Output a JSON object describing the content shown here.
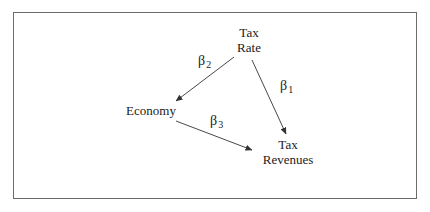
{
  "diagram": {
    "type": "causal-path-diagram",
    "nodes": [
      {
        "id": "tax_rate",
        "lines": [
          "Tax",
          "Rate"
        ]
      },
      {
        "id": "economy",
        "lines": [
          "Economy"
        ]
      },
      {
        "id": "tax_revenues",
        "lines": [
          "Tax",
          "Revenues"
        ]
      }
    ],
    "edges": [
      {
        "from": "tax_rate",
        "to": "tax_revenues",
        "label_symbol": "β",
        "label_subscript": "1"
      },
      {
        "from": "tax_rate",
        "to": "economy",
        "label_symbol": "β",
        "label_subscript": "2"
      },
      {
        "from": "economy",
        "to": "tax_revenues",
        "label_symbol": "β",
        "label_subscript": "3"
      }
    ],
    "colors": {
      "frame": "#6b6b6b",
      "arrow": "#333333",
      "text": "#1a1a1a"
    }
  }
}
